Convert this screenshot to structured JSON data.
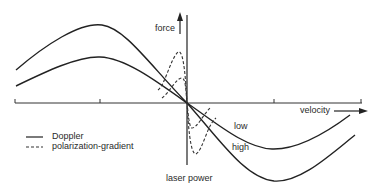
{
  "diagram": {
    "type": "force-velocity curves",
    "axes": {
      "y_label": "force",
      "x_label": "velocity",
      "bottom_label": "laser power"
    },
    "curve_labels": {
      "low": "low",
      "high": "high"
    },
    "legend": [
      {
        "style": "solid",
        "label": "Doppler"
      },
      {
        "style": "dashed",
        "label": "polarization-gradient"
      }
    ],
    "colors": {
      "line": "#222222",
      "background": "#ffffff"
    }
  }
}
